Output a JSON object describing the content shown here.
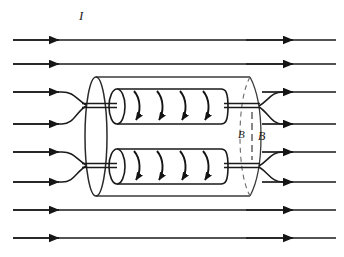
{
  "figure": {
    "background_color": "#ffffff",
    "line_color": "#1a1a1a",
    "faint_line_color": "#4a4a4a",
    "labels": {
      "current": "I",
      "flux_inner": "B",
      "flux_outer": "B"
    },
    "label_positions": {
      "current": {
        "x": 79,
        "y": 20,
        "font_size": 13
      },
      "flux_inner": {
        "x": 238,
        "y": 138,
        "font_size": 11
      },
      "flux_outer": {
        "x": 258,
        "y": 140,
        "font_size": 12
      }
    }
  },
  "field_lines": {
    "description": "Horizontal magnetic field lines with mid-line and far-right arrowheads",
    "x_start": 13,
    "x_end": 336,
    "arrow_x_left": 58,
    "arrow_x_right": 292,
    "straight_rows_y": [
      40,
      64,
      210,
      238
    ],
    "converging_rows": [
      {
        "in_y": [
          92,
          124
        ],
        "junction_y": 105,
        "junction_x": 86
      },
      {
        "in_y": [
          152,
          182
        ],
        "junction_y": 165,
        "junction_x": 86
      }
    ],
    "diverging_rows": [
      {
        "out_y": [
          92,
          124
        ],
        "junction_y": 105,
        "junction_x": 258
      },
      {
        "out_y": [
          152,
          182
        ],
        "junction_y": 165,
        "junction_x": 258
      }
    ]
  },
  "outer_cylinder": {
    "left_ellipse_cx": 96,
    "left_ellipse_rx": 11,
    "top_y": 77,
    "bottom_y": 196,
    "right_x": 250,
    "right_cap_rx": 11,
    "dashed_seam_x": 252
  },
  "inner_coils": [
    {
      "name": "upper-coil",
      "left_x": 117,
      "right_x": 228,
      "top_y": 89,
      "bottom_y": 124,
      "cap_rx": 8,
      "turn_count": 4,
      "lead_left_y": 105,
      "lead_right_y": 105
    },
    {
      "name": "lower-coil",
      "left_x": 117,
      "right_x": 228,
      "top_y": 149,
      "bottom_y": 184,
      "cap_rx": 8,
      "turn_count": 4,
      "lead_left_y": 165,
      "lead_right_y": 165
    }
  ]
}
